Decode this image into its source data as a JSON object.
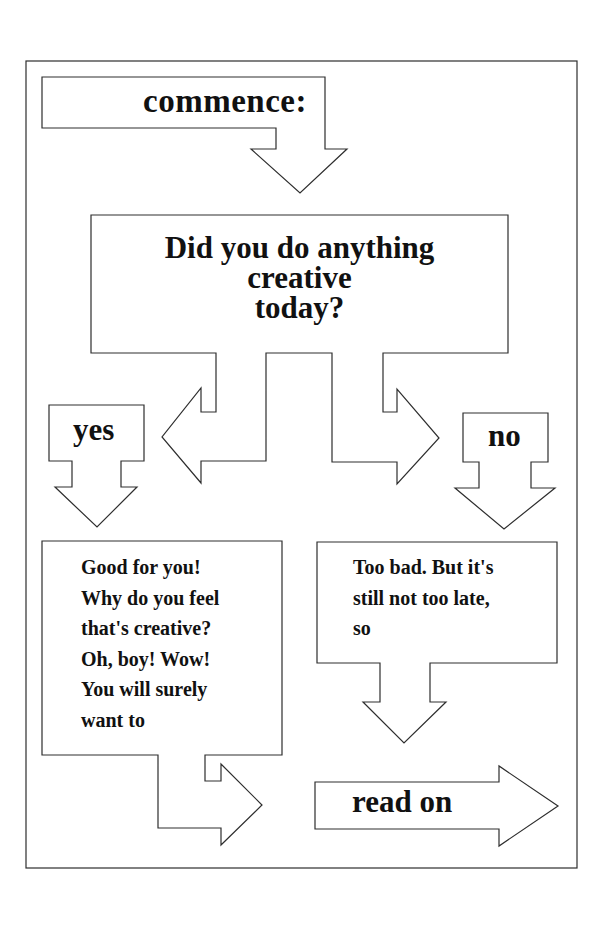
{
  "flowchart": {
    "start": {
      "label": "commence:"
    },
    "question": {
      "lines": [
        "Did you do anything",
        "creative",
        "today?"
      ]
    },
    "branches": {
      "yes": {
        "label": "yes",
        "response_lines": [
          "Good for you!",
          "Why do you feel",
          "that's creative?",
          "Oh, boy! Wow!",
          "You will surely",
          "want to"
        ]
      },
      "no": {
        "label": "no",
        "response_lines": [
          "Too bad. But it's",
          "still not too late,",
          "so"
        ]
      }
    },
    "end": {
      "label": "read on"
    }
  },
  "colors": {
    "background": "#ffffff",
    "stroke": "#2e2e2e",
    "text": "#111111"
  }
}
